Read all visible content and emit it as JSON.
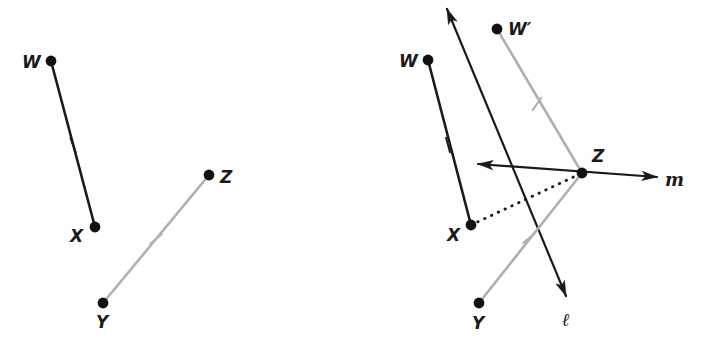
{
  "figure": {
    "background_color": "#ffffff",
    "width": 714,
    "height": 354,
    "colors": {
      "black": "#1a1a1a",
      "gray": "#b0b0b0",
      "point_fill": "#111111"
    }
  },
  "panels": [
    {
      "id": "left-panel",
      "name": "given-segments-panel",
      "points": [
        {
          "id": "W",
          "label": "W",
          "x": 51,
          "y": 61,
          "label_x": 22,
          "label_y": 68
        },
        {
          "id": "X",
          "label": "X",
          "x": 95,
          "y": 227,
          "label_x": 70,
          "label_y": 242
        },
        {
          "id": "Y",
          "label": "Y",
          "x": 103,
          "y": 303,
          "label_x": 96,
          "label_y": 328
        },
        {
          "id": "Z",
          "label": "Z",
          "x": 209,
          "y": 175,
          "label_x": 220,
          "label_y": 183
        }
      ],
      "segments": [
        {
          "id": "WX",
          "name": "segment-wx",
          "from": "W",
          "to": "X",
          "color": "black",
          "width": 2.6,
          "tick": {
            "x": 73,
            "y": 145,
            "angle": 70
          }
        },
        {
          "id": "YZ",
          "name": "segment-yz",
          "from": "Y",
          "to": "Z",
          "color": "gray",
          "width": 2.6,
          "tick": {
            "x": 156,
            "y": 239,
            "angle": 140
          }
        }
      ]
    },
    {
      "id": "right-panel",
      "name": "construction-panel",
      "points": [
        {
          "id": "W2",
          "label": "W",
          "x": 428,
          "y": 60,
          "label_x": 399,
          "label_y": 67
        },
        {
          "id": "Wprime",
          "label": "W′",
          "x": 497,
          "y": 29,
          "label_x": 508,
          "label_y": 35
        },
        {
          "id": "X2",
          "label": "X",
          "x": 471,
          "y": 225,
          "label_x": 447,
          "label_y": 241
        },
        {
          "id": "Y2",
          "label": "Y",
          "x": 479,
          "y": 303,
          "label_x": 472,
          "label_y": 329
        },
        {
          "id": "Z2",
          "label": "Z",
          "x": 582,
          "y": 173,
          "label_x": 592,
          "label_y": 162
        }
      ],
      "segments": [
        {
          "id": "WX2",
          "name": "segment-wx-copy",
          "from": "W2",
          "to": "X2",
          "color": "black",
          "width": 2.6,
          "tick": {
            "x": 448,
            "y": 145,
            "angle": 75
          }
        },
        {
          "id": "WprimeZ",
          "name": "segment-wprime-z",
          "from": "Wprime",
          "to": "Z2",
          "color": "gray",
          "width": 2.6,
          "tick": {
            "x": 537,
            "y": 104,
            "angle": 125
          }
        },
        {
          "id": "YZ2",
          "name": "segment-yz-copy",
          "from": "Y2",
          "to": "Z2",
          "color": "gray",
          "width": 2.6,
          "tick": {
            "x": 529,
            "y": 238,
            "angle": 140
          }
        }
      ],
      "dotted": [
        {
          "id": "XZ",
          "name": "dotted-segment-xz",
          "from": "X2",
          "to": "Z2",
          "color": "black",
          "width": 2.8,
          "dash": "0.5 7"
        }
      ],
      "lines": [
        {
          "id": "l",
          "name": "line-l",
          "label": "ℓ",
          "label_x": 562,
          "label_y": 326,
          "color": "black",
          "width": 2.2,
          "x1": 447,
          "y1": 9,
          "x2": 566,
          "y2": 296,
          "arrow_start": true,
          "arrow_end": true
        },
        {
          "id": "m",
          "name": "line-m",
          "label": "m",
          "label_x": 665,
          "label_y": 186,
          "color": "black",
          "width": 2.2,
          "x1": 478,
          "y1": 164,
          "x2": 657,
          "y2": 177,
          "arrow_start": true,
          "arrow_end": true
        }
      ]
    }
  ]
}
